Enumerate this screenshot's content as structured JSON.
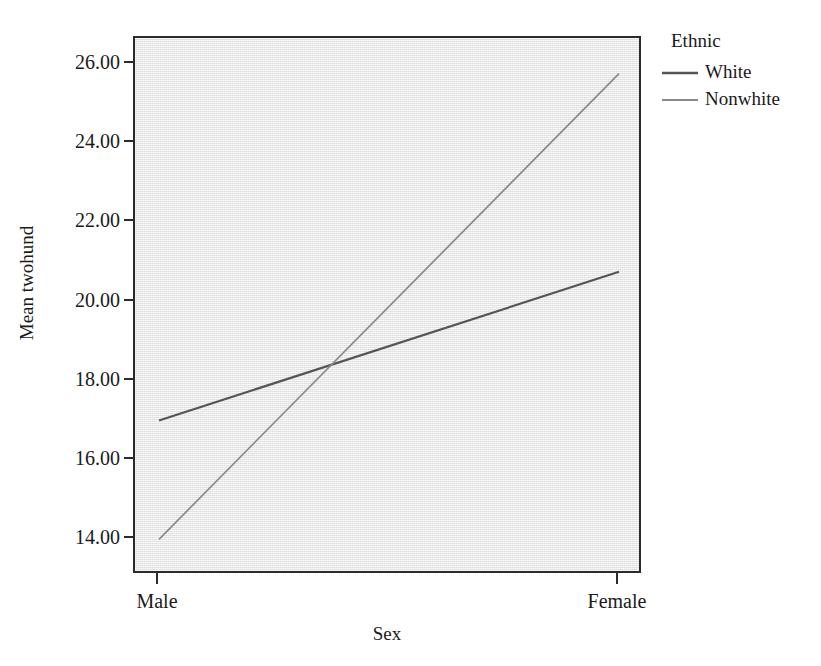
{
  "chart_data": {
    "type": "line",
    "title": "",
    "subtitle": "",
    "xlabel": "Sex",
    "ylabel": "Mean twohund",
    "categories": [
      "Male",
      "Female"
    ],
    "series": [
      {
        "name": "White",
        "values": [
          17.0,
          20.75
        ],
        "color": "#555555",
        "width": 2.2
      },
      {
        "name": "Nonwhite",
        "values": [
          14.0,
          25.75
        ],
        "color": "#8a8a8a",
        "width": 1.7
      }
    ],
    "ylim": [
      13.1,
      26.65
    ],
    "yticks": [
      14.0,
      16.0,
      18.0,
      20.0,
      22.0,
      24.0,
      26.0
    ],
    "ytick_labels": [
      "14.00",
      "16.00",
      "18.00",
      "20.00",
      "22.00",
      "24.00",
      "26.00"
    ],
    "xtick_labels": [
      "Male",
      "Female"
    ],
    "grid": false,
    "legend": {
      "title": "Ethnic",
      "position": "right-top",
      "entries": [
        {
          "label": "White",
          "color": "#555555"
        },
        {
          "label": "Nonwhite",
          "color": "#8a8a8a"
        }
      ]
    },
    "plot_background": "#ededed",
    "frame_color": "#2b2b2b",
    "annotations": []
  },
  "axes": {
    "y_title": "Mean twohund",
    "x_title": "Sex"
  },
  "legend": {
    "title": "Ethnic",
    "entry0_label": "White",
    "entry1_label": "Nonwhite"
  },
  "yticks": {
    "t0": "14.00",
    "t1": "16.00",
    "t2": "18.00",
    "t3": "20.00",
    "t4": "22.00",
    "t5": "24.00",
    "t6": "26.00"
  },
  "xticks": {
    "t0": "Male",
    "t1": "Female"
  }
}
